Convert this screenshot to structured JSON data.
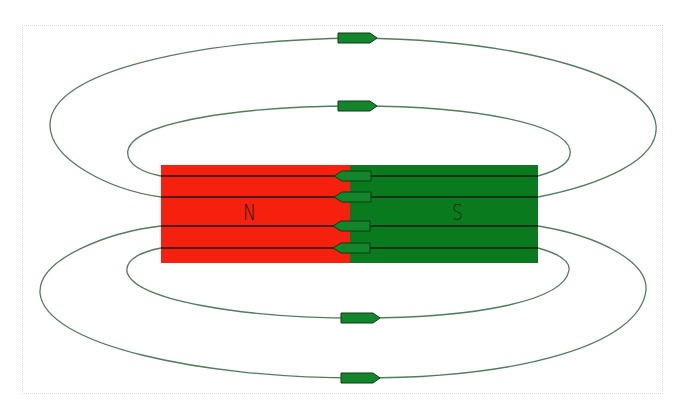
{
  "diagram": {
    "magnet": {
      "north": {
        "label": "N",
        "color": "#f5200e"
      },
      "south": {
        "label": "S",
        "color": "#0a7a1e"
      }
    },
    "field_line_color": "#4f7f57",
    "internal_line_color": "#1a1a1a",
    "arrow_fill": "#13852b",
    "arrow_stroke": "#0d3a14",
    "arrows": [
      {
        "id": "outer-top",
        "direction": "right"
      },
      {
        "id": "inner-top",
        "direction": "right"
      },
      {
        "id": "inside-1",
        "direction": "left"
      },
      {
        "id": "inside-2",
        "direction": "left"
      },
      {
        "id": "inside-3",
        "direction": "left"
      },
      {
        "id": "inside-4",
        "direction": "left"
      },
      {
        "id": "inner-bottom",
        "direction": "right"
      },
      {
        "id": "outer-bottom",
        "direction": "right"
      }
    ]
  }
}
